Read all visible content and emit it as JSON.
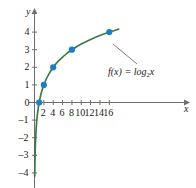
{
  "chart_data": {
    "type": "line",
    "title": "",
    "xlabel": "x",
    "ylabel": "y",
    "function_label": "f(x) = log",
    "function_base": "2",
    "function_arg": "x",
    "equation": "f(x) = log_2 x",
    "xlim": [
      -1.2,
      18.5
    ],
    "ylim": [
      -4.6,
      4.6
    ],
    "grid": false,
    "legend": "none",
    "curve_color": "#3d7a4a",
    "point_color": "#1b7fc3",
    "axis_color": "#6e6e6e",
    "text_color": "#1a1a1a",
    "x_ticks": [
      2,
      4,
      6,
      8,
      10,
      12,
      14,
      16
    ],
    "x_tick_labels": [
      "2",
      "4",
      "6",
      "8",
      "10",
      "12",
      "14",
      "16"
    ],
    "y_ticks": [
      4,
      3,
      2,
      1,
      0,
      -1,
      -2,
      -3,
      -4
    ],
    "y_tick_labels": [
      "4",
      "3",
      "2",
      "1",
      "0",
      "–1",
      "–2",
      "–3",
      "–4"
    ],
    "points": [
      {
        "x": 1,
        "y": 0
      },
      {
        "x": 2,
        "y": 1
      },
      {
        "x": 4,
        "y": 2
      },
      {
        "x": 8,
        "y": 3
      },
      {
        "x": 16,
        "y": 4
      }
    ],
    "curve": [
      {
        "x": 0.055,
        "y": -4.18
      },
      {
        "x": 0.07,
        "y": -3.84
      },
      {
        "x": 0.09,
        "y": -3.47
      },
      {
        "x": 0.12,
        "y": -3.06
      },
      {
        "x": 0.16,
        "y": -2.64
      },
      {
        "x": 0.21,
        "y": -2.25
      },
      {
        "x": 0.28,
        "y": -1.84
      },
      {
        "x": 0.37,
        "y": -1.43
      },
      {
        "x": 0.5,
        "y": -1.0
      },
      {
        "x": 0.65,
        "y": -0.62
      },
      {
        "x": 0.8,
        "y": -0.32
      },
      {
        "x": 1.0,
        "y": 0.0
      },
      {
        "x": 1.3,
        "y": 0.38
      },
      {
        "x": 1.6,
        "y": 0.68
      },
      {
        "x": 2.0,
        "y": 1.0
      },
      {
        "x": 2.5,
        "y": 1.32
      },
      {
        "x": 3.0,
        "y": 1.58
      },
      {
        "x": 4.0,
        "y": 2.0
      },
      {
        "x": 5.0,
        "y": 2.32
      },
      {
        "x": 6.0,
        "y": 2.58
      },
      {
        "x": 7.0,
        "y": 2.81
      },
      {
        "x": 8.0,
        "y": 3.0
      },
      {
        "x": 10.0,
        "y": 3.32
      },
      {
        "x": 12.0,
        "y": 3.58
      },
      {
        "x": 14.0,
        "y": 3.81
      },
      {
        "x": 16.0,
        "y": 4.0
      },
      {
        "x": 18.0,
        "y": 4.17
      }
    ]
  }
}
